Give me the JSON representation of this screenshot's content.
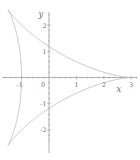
{
  "figure": {
    "background": "#ffffff"
  },
  "chart_data": {
    "type": "line",
    "curve_name": "deltoid (three-cusped hypocycloid)",
    "parametric": {
      "x_formula": "2 cos(t) + cos(2t)",
      "y_formula": "2 sin(t) - sin(2t)",
      "a": 2,
      "b": 1,
      "t_min": 0,
      "t_max": 6.283185307,
      "samples": 480
    },
    "xlabel": "x",
    "ylabel": "y",
    "origin_label": "0",
    "x_ticks": [
      {
        "value": -1,
        "label": "-1"
      },
      {
        "value": 1,
        "label": "1"
      },
      {
        "value": 2,
        "label": "2"
      },
      {
        "value": 3,
        "label": "3"
      }
    ],
    "y_ticks": [
      {
        "value": -2,
        "label": "-2"
      },
      {
        "value": -1,
        "label": "-1"
      },
      {
        "value": 1,
        "label": "1"
      },
      {
        "value": 2,
        "label": "2"
      }
    ],
    "minor_tick_step": 0.2,
    "x_range": [
      -1.72,
      3.21
    ],
    "y_range": [
      -2.52,
      2.52
    ],
    "grid": false,
    "legend": null,
    "key_points": {
      "right_cusp": [
        3,
        0
      ],
      "upper_left_cusp": [
        -1.5,
        2.598
      ],
      "lower_left_cusp": [
        -1.5,
        -2.598
      ],
      "x_axis_crossing": [
        -1,
        0
      ],
      "y_axis_crossings": [
        [
          0,
          1.178
        ],
        [
          0,
          -1.178
        ]
      ]
    },
    "colors": {
      "curve": "#b6babb",
      "axis": "#909090",
      "tick": "#909090",
      "label": "#6e6e6e"
    }
  }
}
